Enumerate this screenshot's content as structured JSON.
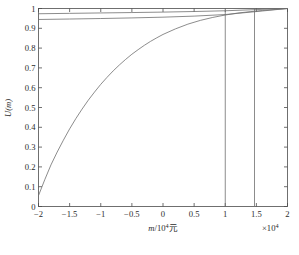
{
  "chart_data": {
    "type": "line",
    "title": "",
    "subtitle": "",
    "xlabel": "m/10⁴元",
    "ylabel": "U(m)",
    "x_multiplier": "×10⁴",
    "xlim": [
      -2,
      2
    ],
    "ylim": [
      0,
      1
    ],
    "grid": false,
    "legend": "none",
    "xticks": [
      -2,
      -1.5,
      -1,
      -0.5,
      0,
      0.5,
      1,
      1.5,
      2
    ],
    "xticklabels": [
      "−2",
      "−1.5",
      "−1",
      "−0.5",
      "0",
      "0.5",
      "1",
      "1.5",
      "2"
    ],
    "yticks": [
      0,
      0.1,
      0.2,
      0.3,
      0.4,
      0.5,
      0.6,
      0.7,
      0.8,
      0.9,
      1
    ],
    "yticklabels": [
      "0",
      "0.1",
      "0.2",
      "0.3",
      "0.4",
      "0.5",
      "0.6",
      "0.7",
      "0.8",
      "0.9",
      "1"
    ],
    "series": [
      {
        "name": "U1",
        "x": [
          -2,
          -1.9,
          -1.8,
          -1.7,
          -1.6,
          -1.5,
          -1.4,
          -1.3,
          -1.2,
          -1.1,
          -1,
          -0.9,
          -0.8,
          -0.7,
          -0.6,
          -0.5,
          -0.4,
          -0.3,
          -0.2,
          -0.1,
          0,
          0.2,
          0.4,
          0.6,
          0.8,
          1,
          1.2,
          1.4,
          1.6,
          1.8,
          2
        ],
        "values": [
          0.055,
          0.135,
          0.21,
          0.275,
          0.335,
          0.392,
          0.444,
          0.492,
          0.537,
          0.578,
          0.617,
          0.652,
          0.685,
          0.715,
          0.743,
          0.769,
          0.792,
          0.814,
          0.834,
          0.852,
          0.869,
          0.897,
          0.921,
          0.94,
          0.955,
          0.967,
          0.977,
          0.984,
          0.99,
          0.995,
          1.0
        ]
      },
      {
        "name": "U2",
        "x": [
          -2,
          -1.5,
          -1,
          -0.5,
          0,
          0.5,
          1,
          1.5,
          2
        ],
        "values": [
          0.9735,
          0.9755,
          0.9775,
          0.9795,
          0.9818,
          0.9848,
          0.9885,
          0.9945,
          1.0
        ]
      },
      {
        "name": "U3",
        "x": [
          -2,
          -1.5,
          -1,
          -0.5,
          0,
          0.5,
          1,
          1.5,
          2
        ],
        "values": [
          0.9445,
          0.9468,
          0.9494,
          0.9525,
          0.9562,
          0.9615,
          0.9695,
          0.9845,
          1.0
        ]
      }
    ],
    "vertical_lines": [
      {
        "name": "vline-1",
        "x": 1,
        "y_top": 0.9885,
        "y_bottom": 0
      },
      {
        "name": "vline-2",
        "x": 1.47,
        "y_top": 0.9985,
        "y_bottom": 0
      }
    ]
  },
  "figure": {
    "y_axis_label": "U(m)",
    "x_axis_label_italic": "m",
    "x_axis_label_rest": "/10",
    "x_axis_label_exp": "4",
    "x_axis_label_unit": "元",
    "x_multiplier_base": "×10",
    "x_multiplier_exp": "4"
  }
}
